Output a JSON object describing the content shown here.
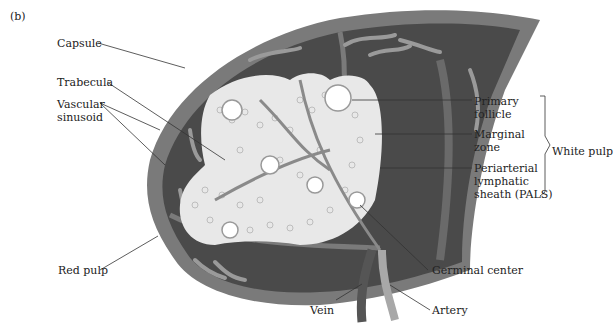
{
  "panel_label": "(b)",
  "labels": {
    "capsule": "Capsule",
    "trabecula": "Trabecula",
    "vascular_sinusoid_1": "Vascular",
    "vascular_sinusoid_2": "sinusoid",
    "red_pulp": "Red pulp",
    "primary_follicle_1": "Primary",
    "primary_follicle_2": "follicle",
    "marginal_zone_1": "Marginal",
    "marginal_zone_2": "zone",
    "pals_1": "Periarterial",
    "pals_2": "lymphatic",
    "pals_3": "sheath (PALS)",
    "white_pulp": "White pulp",
    "germinal_center": "Germinal center",
    "vein": "Vein",
    "artery": "Artery"
  },
  "colors": {
    "capsule": "#7a7a7a",
    "red_pulp": "#4a4a4a",
    "sinusoid": "#9a9a9a",
    "white_pulp": "#e8e8e8",
    "vein": "#555555",
    "artery": "#a8a8a8"
  }
}
